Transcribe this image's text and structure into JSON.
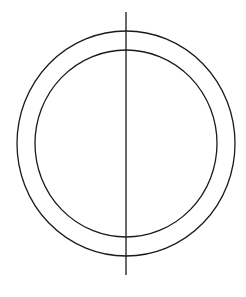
{
  "diagram": {
    "background": "#ffffff",
    "stroke_color": "#1a1a1a",
    "stroke_width": 1.3,
    "outer_circle": {
      "cx": 126,
      "cy": 143.5,
      "rx": 109,
      "ry": 112.5
    },
    "inner_circle": {
      "cx": 126,
      "cy": 143.5,
      "rx": 91,
      "ry": 93.5
    },
    "vertical_line": {
      "x": 126,
      "y1": 12,
      "y2": 275
    }
  }
}
